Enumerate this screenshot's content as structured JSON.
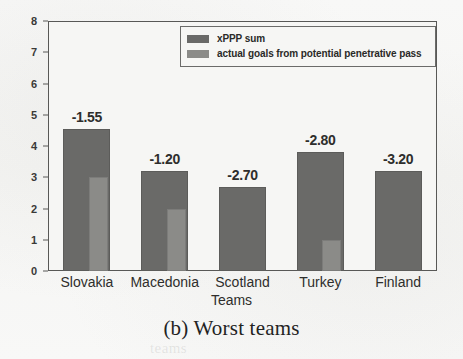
{
  "caption": "(b) Worst teams",
  "chart_data": {
    "type": "bar",
    "title": "",
    "xlabel": "Teams",
    "ylabel": "",
    "ylim": [
      0,
      8
    ],
    "yticks": [
      0,
      1,
      2,
      3,
      4,
      5,
      6,
      7,
      8
    ],
    "grid": false,
    "legend_position": "upper right",
    "categories": [
      "Slovakia",
      "Macedonia",
      "Scotland",
      "Turkey",
      "Finland"
    ],
    "series": [
      {
        "name": "xPPP sum",
        "color": "#6a6a68",
        "values": [
          4.55,
          3.2,
          2.7,
          3.8,
          3.2
        ]
      },
      {
        "name": "actual goals from potential penetrative pass",
        "color": "#8b8b88",
        "values": [
          3.0,
          2.0,
          0.0,
          1.0,
          0.0
        ]
      }
    ],
    "annotations": [
      "-1.55",
      "-1.20",
      "-2.70",
      "-2.80",
      "-3.20"
    ]
  },
  "ghost": {
    "line1": "potential penetrative",
    "line2": "teams"
  }
}
